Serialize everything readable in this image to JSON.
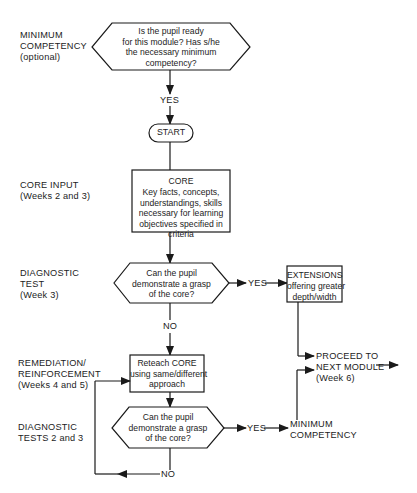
{
  "diagram": {
    "type": "flowchart",
    "stage_labels": {
      "minimum_competency": "MINIMUM\nCOMPETENCY\n(optional)",
      "core_input": "CORE INPUT\n(Weeks 2 and 3)",
      "diagnostic_test": "DIAGNOSTIC\nTEST\n(Week 3)",
      "remediation": "REMEDIATION/\nREINFORCEMENT\n(Weeks 4 and 5)",
      "diagnostic_tests_2_3": "DIAGNOSTIC\nTESTS 2 and 3"
    },
    "nodes": {
      "readiness_decision": "Is the pupil ready\nfor this module? Has s/he\nthe necessary minimum\ncompetency?",
      "start": "START",
      "core_title": "CORE",
      "core_body": "Key facts, concepts,\nunderstandings, skills\nnecessary for learning\nobjectives specified in\ncriteria",
      "diagnostic_decision": "Can the pupil\ndemonstrate a grasp\nof the core?",
      "extensions_title": "EXTENSIONS",
      "extensions_body": "offering greater\ndepth/width",
      "reteach": "Reteach CORE\nusing same/different\napproach",
      "diagnostic_decision_2": "Can the pupil\ndemonstrate a grasp\nof the core?",
      "minimum_competency_result": "MINIMUM\nCOMPETENCY",
      "proceed": "PROCEED TO\nNEXT MODULE\n(Week 6)"
    },
    "edge_labels": {
      "yes_top": "YES",
      "yes_diag1": "YES",
      "no_diag1": "NO",
      "yes_diag2": "YES",
      "no_diag2": "NO"
    },
    "colors": {
      "stroke": "#1a1a1a",
      "background": "#ffffff"
    }
  }
}
